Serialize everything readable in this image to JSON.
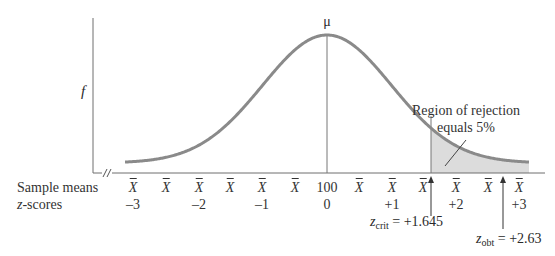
{
  "diagram": {
    "y_axis_label": "f",
    "mean_label": "μ",
    "region_label_line1": "Region of rejection",
    "region_label_line2": "equals 5%",
    "rows": {
      "sample_means_label": "Sample means",
      "z_scores_label": "z-scores"
    },
    "sample_means": [
      {
        "x": 133,
        "text": "X",
        "bar": true
      },
      {
        "x": 166,
        "text": "X",
        "bar": true
      },
      {
        "x": 199,
        "text": "X",
        "bar": true
      },
      {
        "x": 230,
        "text": "X",
        "bar": true
      },
      {
        "x": 262,
        "text": "X",
        "bar": true
      },
      {
        "x": 295,
        "text": "X",
        "bar": true
      },
      {
        "x": 327,
        "text": "100",
        "bar": false
      },
      {
        "x": 359,
        "text": "X",
        "bar": true
      },
      {
        "x": 392,
        "text": "X",
        "bar": true
      },
      {
        "x": 423,
        "text": "X",
        "bar": true
      },
      {
        "x": 456,
        "text": "X",
        "bar": true
      },
      {
        "x": 488,
        "text": "X",
        "bar": true
      },
      {
        "x": 519,
        "text": "X",
        "bar": true
      }
    ],
    "z_scores": [
      {
        "x": 133,
        "text": "–3"
      },
      {
        "x": 199,
        "text": "–2"
      },
      {
        "x": 262,
        "text": "–1"
      },
      {
        "x": 327,
        "text": "0"
      },
      {
        "x": 392,
        "text": "+1"
      },
      {
        "x": 456,
        "text": "+2"
      },
      {
        "x": 519,
        "text": "+3"
      }
    ],
    "z_crit": {
      "symbol": "z",
      "subscript": "crit",
      "value": "= +1.645",
      "x": 431
    },
    "z_obt": {
      "symbol": "z",
      "subscript": "obt",
      "value": "= +2.63",
      "x": 503
    },
    "rejection_region_percent": "5%",
    "mean_value": "100"
  },
  "geometry": {
    "y_axis_x": 93,
    "y_axis_top": 18,
    "baseline_y": 173,
    "baseline_end": 545,
    "mean_x": 327,
    "peak_y": 35,
    "tail_y": 163,
    "curve_start_x": 125,
    "curve_end_x": 529,
    "sd_px": 64.5,
    "crit_x": 431
  },
  "colors": {
    "curve": "#8a8a8a",
    "axis": "#6e6e6e",
    "shade": "#dcdcdc",
    "text": "#333333"
  }
}
